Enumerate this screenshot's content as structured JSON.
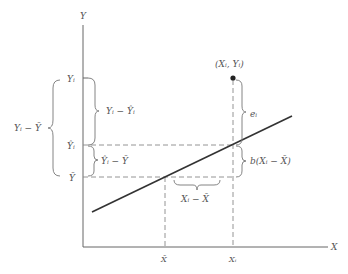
{
  "diagram": {
    "type": "regression-decomposition",
    "axes": {
      "x_label": "X",
      "y_label": "Y",
      "x_ticks": [
        {
          "id": "xbar",
          "label": "X̄"
        },
        {
          "id": "xi",
          "label": "Xᵢ"
        }
      ],
      "y_ticks": [
        {
          "id": "yi",
          "label": "Yᵢ"
        },
        {
          "id": "yhat",
          "label": "Ŷᵢ"
        },
        {
          "id": "ybar",
          "label": "Ȳ"
        }
      ]
    },
    "point": {
      "label": "(Xᵢ, Yᵢ)"
    },
    "braces": {
      "total_deviation": "Yᵢ − Ȳ",
      "residual_left": "Yᵢ − Ŷᵢ",
      "explained_left": "Ŷᵢ − Ȳ",
      "residual_right": "eᵢ",
      "explained_right": "b(Xᵢ − X̄)",
      "x_deviation": "Xᵢ − X̄"
    },
    "colors": {
      "line": "#333333",
      "axis": "#555555",
      "dashed": "#888888",
      "text": "#555555"
    }
  }
}
